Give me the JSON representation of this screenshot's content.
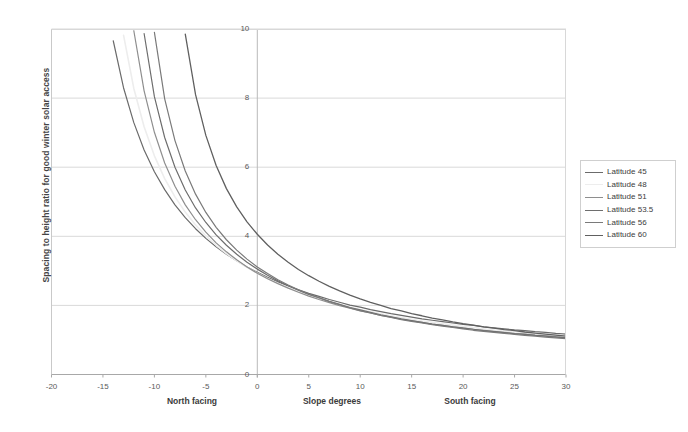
{
  "chart_data": {
    "type": "line",
    "title": "",
    "xlabel": "Slope degrees",
    "ylabel": "Spacing to height ratio for good winter solar access",
    "xlim": [
      -20,
      30
    ],
    "ylim": [
      0,
      10
    ],
    "xticks": [
      "-20",
      "-15",
      "-10",
      "-5",
      "0",
      "5",
      "10",
      "15",
      "20",
      "25",
      "30"
    ],
    "xtick_values": [
      -20,
      -15,
      -10,
      -5,
      0,
      5,
      10,
      15,
      20,
      25,
      30
    ],
    "yticks": [
      "0",
      "2",
      "4",
      "6",
      "8",
      "10"
    ],
    "ytick_values": [
      0,
      2,
      4,
      6,
      8,
      10
    ],
    "grid": "horizontal",
    "legend_position": "right-outside",
    "x_region_labels": [
      {
        "text": "North facing",
        "at": -10
      },
      {
        "text": "Slope degrees",
        "at": 0
      },
      {
        "text": "South facing",
        "at": 17.5
      }
    ],
    "series": [
      {
        "name": "Latitude 45",
        "color": "#6b6b6b",
        "width": 1.2,
        "x": [
          -20,
          -19,
          -18,
          -17,
          -16,
          -15,
          -14,
          -13,
          -12,
          -11,
          -10,
          -9,
          -8,
          -7,
          -6,
          -5,
          -4,
          -3,
          -2,
          -1,
          0,
          1,
          2,
          3,
          4,
          5,
          6,
          7,
          8,
          9,
          10,
          11,
          12,
          13,
          14,
          15,
          16,
          17,
          18,
          19,
          20,
          21,
          22,
          23,
          24,
          25,
          26,
          27,
          28,
          29,
          30
        ],
        "y": [
          null,
          null,
          null,
          null,
          null,
          null,
          9.66,
          8.3,
          7.29,
          6.5,
          5.87,
          5.35,
          4.91,
          4.54,
          4.22,
          3.94,
          3.7,
          3.48,
          3.29,
          3.11,
          2.96,
          2.81,
          2.68,
          2.56,
          2.45,
          2.35,
          2.26,
          2.17,
          2.09,
          2.01,
          1.95,
          1.88,
          1.82,
          1.76,
          1.71,
          1.66,
          1.61,
          1.57,
          1.53,
          1.49,
          1.45,
          1.42,
          1.38,
          1.35,
          1.32,
          1.29,
          1.27,
          1.24,
          1.22,
          1.19,
          1.17
        ]
      },
      {
        "name": "Latitude 48",
        "color": "#ededed",
        "width": 1.6,
        "x": [
          -20,
          -19,
          -18,
          -17,
          -16,
          -15,
          -14,
          -13,
          -12,
          -11,
          -10,
          -9,
          -8,
          -7,
          -6,
          -5,
          -4,
          -3,
          -2,
          -1,
          0,
          1,
          2,
          3,
          4,
          5,
          6,
          7,
          8,
          9,
          10,
          11,
          12,
          13,
          14,
          15,
          16,
          17,
          18,
          19,
          20,
          21,
          22,
          23,
          24,
          25,
          26,
          27,
          28,
          29,
          30
        ],
        "y": [
          null,
          null,
          null,
          null,
          null,
          null,
          null,
          9.82,
          8.28,
          7.17,
          6.33,
          5.67,
          5.14,
          4.7,
          4.33,
          4.01,
          3.74,
          3.5,
          3.29,
          3.1,
          2.93,
          2.78,
          2.64,
          2.52,
          2.4,
          2.3,
          2.2,
          2.11,
          2.03,
          1.95,
          1.88,
          1.82,
          1.76,
          1.7,
          1.65,
          1.6,
          1.55,
          1.51,
          1.47,
          1.43,
          1.39,
          1.36,
          1.32,
          1.29,
          1.26,
          1.24,
          1.21,
          1.19,
          1.16,
          1.14,
          1.12
        ]
      },
      {
        "name": "Latitude 51",
        "color": "#8e8e8e",
        "width": 1.2,
        "x": [
          -20,
          -19,
          -18,
          -17,
          -16,
          -15,
          -14,
          -13,
          -12,
          -11,
          -10,
          -9,
          -8,
          -7,
          -6,
          -5,
          -4,
          -3,
          -2,
          -1,
          0,
          1,
          2,
          3,
          4,
          5,
          6,
          7,
          8,
          9,
          10,
          11,
          12,
          13,
          14,
          15,
          16,
          17,
          18,
          19,
          20,
          21,
          22,
          23,
          24,
          25,
          26,
          27,
          28,
          29,
          30
        ],
        "y": [
          null,
          null,
          null,
          null,
          null,
          null,
          null,
          null,
          9.95,
          8.21,
          7.01,
          6.12,
          5.45,
          4.91,
          4.48,
          4.12,
          3.81,
          3.55,
          3.32,
          3.11,
          2.93,
          2.77,
          2.63,
          2.5,
          2.38,
          2.27,
          2.17,
          2.08,
          1.99,
          1.92,
          1.84,
          1.78,
          1.71,
          1.66,
          1.6,
          1.55,
          1.51,
          1.46,
          1.42,
          1.38,
          1.35,
          1.31,
          1.28,
          1.25,
          1.22,
          1.19,
          1.17,
          1.14,
          1.12,
          1.1,
          1.07
        ]
      },
      {
        "name": "Latitude 53.5",
        "color": "#6e6e6e",
        "width": 1.2,
        "x": [
          -20,
          -19,
          -18,
          -17,
          -16,
          -15,
          -14,
          -13,
          -12,
          -11,
          -10,
          -9,
          -8,
          -7,
          -6,
          -5,
          -4,
          -3,
          -2,
          -1,
          0,
          1,
          2,
          3,
          4,
          5,
          6,
          7,
          8,
          9,
          10,
          11,
          12,
          13,
          14,
          15,
          16,
          17,
          18,
          19,
          20,
          21,
          22,
          23,
          24,
          25,
          26,
          27,
          28,
          29,
          30
        ],
        "y": [
          null,
          null,
          null,
          null,
          null,
          null,
          null,
          null,
          null,
          9.87,
          8.04,
          6.86,
          6.0,
          5.34,
          4.82,
          4.4,
          4.04,
          3.74,
          3.48,
          3.25,
          3.05,
          2.87,
          2.71,
          2.57,
          2.44,
          2.32,
          2.22,
          2.12,
          2.03,
          1.94,
          1.87,
          1.8,
          1.73,
          1.67,
          1.61,
          1.56,
          1.51,
          1.46,
          1.42,
          1.38,
          1.34,
          1.31,
          1.27,
          1.24,
          1.21,
          1.18,
          1.16,
          1.13,
          1.11,
          1.08,
          1.06
        ]
      },
      {
        "name": "Latitude 56",
        "color": "#7a7a7a",
        "width": 1.2,
        "x": [
          -20,
          -19,
          -18,
          -17,
          -16,
          -15,
          -14,
          -13,
          -12,
          -11,
          -10,
          -9,
          -8,
          -7,
          -6,
          -5,
          -4,
          -3,
          -2,
          -1,
          0,
          1,
          2,
          3,
          4,
          5,
          6,
          7,
          8,
          9,
          10,
          11,
          12,
          13,
          14,
          15,
          16,
          17,
          18,
          19,
          20,
          21,
          22,
          23,
          24,
          25,
          26,
          27,
          28,
          29,
          30
        ],
        "y": [
          null,
          null,
          null,
          null,
          null,
          null,
          null,
          null,
          null,
          null,
          9.9,
          7.98,
          6.77,
          5.89,
          5.22,
          4.69,
          4.26,
          3.9,
          3.6,
          3.34,
          3.11,
          2.92,
          2.74,
          2.59,
          2.45,
          2.33,
          2.22,
          2.11,
          2.02,
          1.93,
          1.85,
          1.78,
          1.71,
          1.65,
          1.59,
          1.54,
          1.49,
          1.44,
          1.4,
          1.36,
          1.32,
          1.28,
          1.25,
          1.22,
          1.19,
          1.16,
          1.13,
          1.11,
          1.08,
          1.06,
          1.04
        ]
      },
      {
        "name": "Latitude 60",
        "color": "#606060",
        "width": 1.3,
        "x": [
          -20,
          -19,
          -18,
          -17,
          -16,
          -15,
          -14,
          -13,
          -12,
          -11,
          -10,
          -9,
          -8,
          -7,
          -6,
          -5,
          -4,
          -3,
          -2,
          -1,
          0,
          1,
          2,
          3,
          4,
          5,
          6,
          7,
          8,
          9,
          10,
          11,
          12,
          13,
          14,
          15,
          16,
          17,
          18,
          19,
          20,
          21,
          22,
          23,
          24,
          25,
          26,
          27,
          28,
          29,
          30
        ],
        "y": [
          null,
          null,
          null,
          null,
          null,
          null,
          null,
          null,
          null,
          null,
          null,
          null,
          null,
          9.85,
          8.1,
          6.92,
          6.05,
          5.38,
          4.85,
          4.42,
          4.06,
          3.75,
          3.48,
          3.25,
          3.04,
          2.86,
          2.7,
          2.55,
          2.42,
          2.3,
          2.19,
          2.09,
          2.0,
          1.91,
          1.84,
          1.76,
          1.7,
          1.63,
          1.58,
          1.52,
          1.47,
          1.43,
          1.38,
          1.34,
          1.3,
          1.27,
          1.23,
          1.2,
          1.17,
          1.14,
          1.11
        ]
      }
    ]
  },
  "legend": {
    "items": [
      {
        "label": "Latitude 45"
      },
      {
        "label": "Latitude 48"
      },
      {
        "label": "Latitude 51"
      },
      {
        "label": "Latitude 53.5"
      },
      {
        "label": "Latitude 56"
      },
      {
        "label": "Latitude 60"
      }
    ]
  },
  "axes": {
    "y_title": "Spacing to height ratio for good winter solar access",
    "x_region_north": "North facing",
    "x_region_center": "Slope degrees",
    "x_region_south": "South facing",
    "x_labels": [
      "-20",
      "-15",
      "-10",
      "-5",
      "0",
      "5",
      "10",
      "15",
      "20",
      "25",
      "30"
    ],
    "y_labels": [
      "0",
      "2",
      "4",
      "6",
      "8",
      "10"
    ]
  },
  "colors": {
    "grid": "#d9d9d9",
    "axis": "#a8a8a8",
    "text": "#3b3b3b",
    "plot_bg": "#ffffff"
  }
}
